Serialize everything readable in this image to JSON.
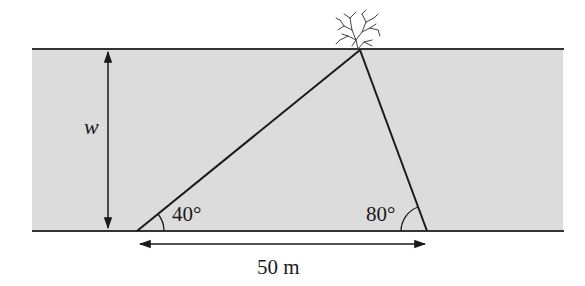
{
  "diagram": {
    "type": "river-width-triangulation",
    "colors": {
      "river_fill": "#dcdcdc",
      "lines": "#1a1a1a",
      "background": "#ffffff"
    },
    "labels": {
      "width_symbol": "w",
      "angle_left": "40°",
      "angle_right": "80°",
      "baseline_distance": "50 m"
    },
    "elements": {
      "river": "shaded band between two riverbank lines",
      "tree": "tree on far bank at triangle apex",
      "triangle": "two sight lines from near bank points to the tree",
      "width_arrow": "vertical double-headed arrow marking width w",
      "distance_arrow": "horizontal double-headed arrow marking 50 m baseline"
    }
  }
}
